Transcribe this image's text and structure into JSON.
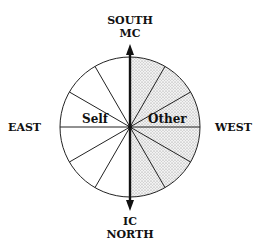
{
  "diagram": {
    "top_label": {
      "line1": "SOUTH",
      "line2": "MC"
    },
    "bottom_label": {
      "line1": "IC",
      "line2": "NORTH"
    },
    "left_label": "EAST",
    "right_label": "WEST",
    "left_half_label": "Self",
    "right_half_label": "Other",
    "segments": 12,
    "shaded_half": "west",
    "colors": {
      "line": "#222222",
      "shade": "#d9d9d9",
      "background": "#ffffff"
    }
  }
}
